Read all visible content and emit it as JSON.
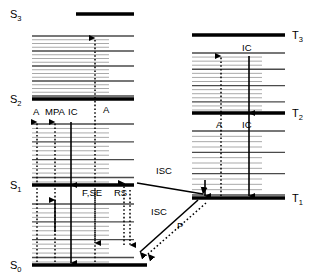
{
  "figure": {
    "kind": "jablonski-diagram",
    "width": 323,
    "height": 280,
    "background": "#ffffff",
    "ink": "#000000",
    "vibronic_color": "#9a9a9a"
  },
  "singlet_states": [
    {
      "id": "S3",
      "symbol": "S",
      "subscript": "3",
      "label": "S3",
      "y": 14,
      "x1": 76,
      "x2": 134,
      "label_x": 10,
      "label_y": 18
    },
    {
      "id": "S2",
      "symbol": "S",
      "subscript": "2",
      "label": "S2",
      "y": 99,
      "x1": 32,
      "x2": 134,
      "label_x": 10,
      "label_y": 103
    },
    {
      "id": "S1",
      "symbol": "S",
      "subscript": "1",
      "label": "S1",
      "y": 185,
      "x1": 32,
      "x2": 134,
      "label_x": 10,
      "label_y": 189
    },
    {
      "id": "S0",
      "symbol": "S",
      "subscript": "0",
      "label": "S0",
      "y": 265,
      "x1": 32,
      "x2": 147,
      "label_x": 10,
      "label_y": 269
    }
  ],
  "triplet_states": [
    {
      "id": "T3",
      "symbol": "T",
      "subscript": "3",
      "label": "T3",
      "y": 35,
      "x1": 192,
      "x2": 285,
      "label_x": 292,
      "label_y": 39
    },
    {
      "id": "T2",
      "symbol": "T",
      "subscript": "2",
      "label": "T2",
      "y": 113,
      "x1": 192,
      "x2": 285,
      "label_x": 292,
      "label_y": 117
    },
    {
      "id": "T1",
      "symbol": "T",
      "subscript": "1",
      "label": "T1",
      "y": 198,
      "x1": 192,
      "x2": 285,
      "label_x": 292,
      "label_y": 202
    }
  ],
  "process_labels": [
    {
      "id": "A-singlet-low",
      "text": "A",
      "x": 33,
      "y": 115,
      "anchor": "start"
    },
    {
      "id": "MPA",
      "text": "MPA",
      "x": 45,
      "y": 115,
      "anchor": "start"
    },
    {
      "id": "IC-s2-s1",
      "text": "IC",
      "x": 68,
      "y": 115,
      "anchor": "start"
    },
    {
      "id": "A-s0-s2",
      "text": "A",
      "x": 103,
      "y": 113,
      "anchor": "start"
    },
    {
      "id": "F-SE",
      "text": "F,SE",
      "x": 82,
      "y": 196,
      "anchor": "start"
    },
    {
      "id": "RS",
      "text": "RS",
      "x": 114,
      "y": 196,
      "anchor": "start"
    },
    {
      "id": "ISC-s1-t1",
      "text": "ISC",
      "x": 156,
      "y": 174,
      "anchor": "start"
    },
    {
      "id": "ISC-t1-s0",
      "text": "ISC",
      "x": 151,
      "y": 215,
      "anchor": "start"
    },
    {
      "id": "P-phosphorescence",
      "text": "P",
      "x": 177,
      "y": 229,
      "anchor": "start"
    },
    {
      "id": "IC-t3-t2",
      "text": "IC",
      "x": 242,
      "y": 51,
      "anchor": "start"
    },
    {
      "id": "A-triplet",
      "text": "A",
      "x": 216,
      "y": 128,
      "anchor": "start"
    },
    {
      "id": "IC-t2-t1",
      "text": "IC",
      "x": 242,
      "y": 128,
      "anchor": "start"
    }
  ],
  "legend_meanings": {
    "A": "Absorption",
    "MPA": "Multi-photon absorption",
    "IC": "Internal conversion",
    "F,SE": "Fluorescence, stimulated emission",
    "RS": "Raman scattering",
    "ISC": "Intersystem crossing",
    "P": "Phosphorescence"
  },
  "vibronic_manifolds": [
    {
      "id": "S3-S2",
      "between": [
        "S3",
        "S2"
      ],
      "x_start": 32,
      "count": 17,
      "y_top": 36,
      "y_bottom": 96,
      "long_every": 4,
      "x_long": 134,
      "x_short": 109
    },
    {
      "id": "S2-S1",
      "between": [
        "S2",
        "S1"
      ],
      "x_start": 32,
      "count": 14,
      "y_top": 124,
      "y_bottom": 182,
      "long_every": 4,
      "x_long": 134,
      "x_short": 109
    },
    {
      "id": "S1-S0",
      "between": [
        "S1",
        "S0"
      ],
      "x_start": 32,
      "count": 14,
      "y_top": 204,
      "y_bottom": 262,
      "long_every": 4,
      "x_long": 134,
      "x_short": 109
    },
    {
      "id": "T3-T2",
      "between": [
        "T3",
        "T2"
      ],
      "x_start": 192,
      "count": 15,
      "y_top": 53,
      "y_bottom": 110,
      "long_every": 4,
      "x_long": 285,
      "x_short": 262
    },
    {
      "id": "T2-T1",
      "between": [
        "T2",
        "T1"
      ],
      "x_start": 192,
      "count": 13,
      "y_top": 131,
      "y_bottom": 195,
      "long_every": 4,
      "x_long": 285,
      "x_short": 262
    }
  ],
  "transitions": [
    {
      "id": "A-s0-s1-up",
      "process": "A",
      "style": "dotted",
      "direction": "up",
      "x": 37,
      "y_from": 262,
      "y_to": 122
    },
    {
      "id": "MPA-s0-s1-up",
      "process": "MPA",
      "style": "dotted",
      "direction": "up",
      "x": 55,
      "y_from": 262,
      "y_to": 122
    },
    {
      "id": "MPA-mid-up",
      "process": "MPA",
      "style": "solid",
      "direction": "up",
      "x": 55,
      "y_from": 232,
      "y_to": 200
    },
    {
      "id": "IC-s2-s1-down",
      "process": "IC",
      "style": "solid",
      "direction": "down",
      "x": 71,
      "y_from": 122,
      "y_to": 185
    },
    {
      "id": "IC-s1-s0-down",
      "process": "IC",
      "style": "solid",
      "direction": "down",
      "x": 71,
      "y_from": 185,
      "y_to": 263
    },
    {
      "id": "A-s0-s3-up",
      "process": "A",
      "style": "dotted",
      "direction": "up",
      "x": 95,
      "y_from": 262,
      "y_to": 38
    },
    {
      "id": "F-SE-s1-s0-down",
      "process": "F,SE",
      "style": "dotted",
      "direction": "down",
      "x": 95,
      "y_from": 190,
      "y_to": 243
    },
    {
      "id": "RS-up",
      "process": "RS",
      "style": "dotted",
      "direction": "up",
      "x": 124,
      "y_from": 245,
      "y_to": 183
    },
    {
      "id": "RS-down",
      "process": "RS",
      "style": "dotted",
      "direction": "down",
      "x": 130,
      "y_from": 190,
      "y_to": 245
    },
    {
      "id": "A-t1-t3-up",
      "process": "A",
      "style": "dotted",
      "direction": "up",
      "x": 221,
      "y_from": 196,
      "y_to": 56
    },
    {
      "id": "IC-t3-t2-down",
      "process": "IC",
      "style": "solid",
      "direction": "down",
      "x": 249,
      "y_from": 56,
      "y_to": 113
    },
    {
      "id": "IC-t2-t1-down",
      "process": "IC",
      "style": "solid",
      "direction": "down",
      "x": 249,
      "y_from": 113,
      "y_to": 196
    },
    {
      "id": "ISC-arrive-t1",
      "process": "ISC",
      "style": "solid",
      "direction": "down",
      "x": 205,
      "y_from": 180,
      "y_to": 196
    }
  ],
  "diagonal_transitions": [
    {
      "id": "ISC-s1-to-t1",
      "process": "ISC",
      "style": "solid",
      "x1": 137,
      "y1": 183,
      "x2": 203,
      "y2": 194
    },
    {
      "id": "ISC-t1-to-s0",
      "process": "ISC",
      "style": "solid",
      "x1": 198,
      "y1": 200,
      "x2": 140,
      "y2": 252
    },
    {
      "id": "P-t1-to-s0",
      "process": "P",
      "style": "dotted",
      "x1": 206,
      "y1": 203,
      "x2": 148,
      "y2": 254
    }
  ]
}
